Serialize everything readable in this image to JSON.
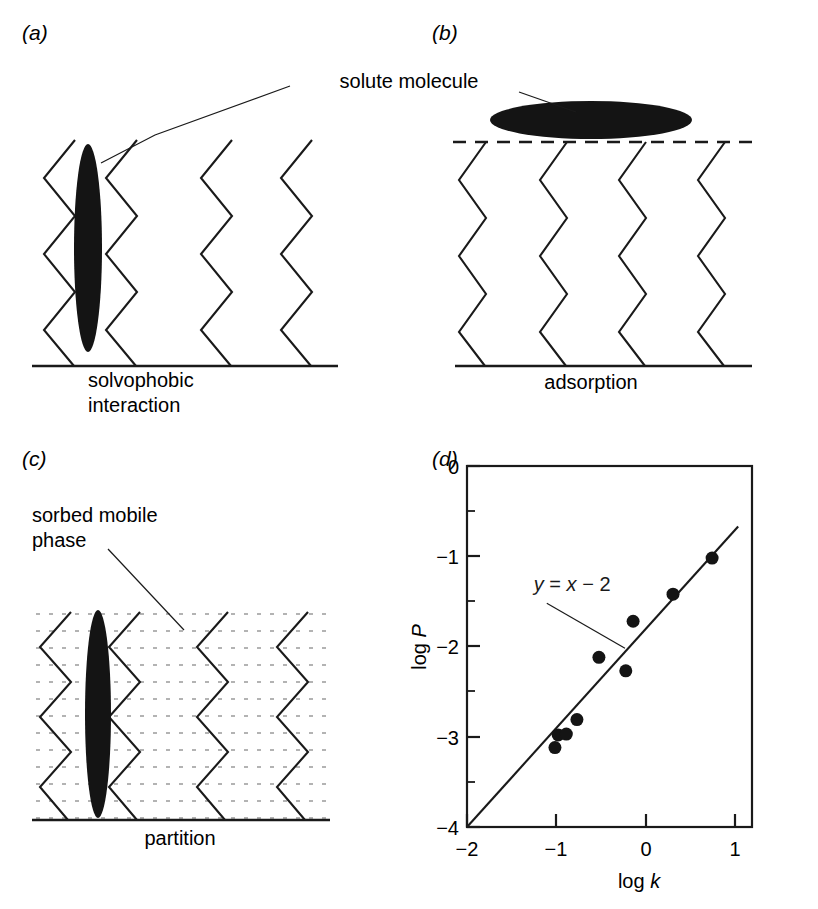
{
  "figure": {
    "panels": [
      {
        "key": "a",
        "label": "(a)",
        "caption_line1": "solvophobic",
        "caption_line2": "interaction",
        "annotation": "solute molecule",
        "chains": 4,
        "molecule_orientation": "vertical-ellipse"
      },
      {
        "key": "b",
        "label": "(b)",
        "caption_line1": "adsorption",
        "caption_line2": "",
        "annotation": "solute molecule",
        "chains": 4,
        "molecule_orientation": "horizontal-ellipse"
      },
      {
        "key": "c",
        "label": "(c)",
        "caption_line1": "partition",
        "caption_line2": "",
        "annotation_line1": "sorbed mobile",
        "annotation_line2": "phase",
        "chains": 4,
        "molecule_orientation": "vertical-ellipse"
      },
      {
        "key": "d",
        "label": "(d)",
        "caption_line1": "",
        "caption_line2": ""
      }
    ],
    "colors": {
      "ink": "#1a1a1a",
      "molecule": "#141414",
      "sorbed_phase_dots": "#9a9a9a"
    }
  },
  "chart_data": {
    "type": "scatter",
    "title": "",
    "xlabel": "log k",
    "ylabel": "log P",
    "xlim": [
      -2,
      1.5
    ],
    "ylim": [
      -4,
      0
    ],
    "xticks": [
      -2,
      -1,
      0,
      1
    ],
    "xtick_labels": [
      "−2",
      "−1",
      "0",
      "1"
    ],
    "yticks": [
      0,
      -1,
      -2,
      -3,
      -4
    ],
    "ytick_labels": [
      "0",
      "−1",
      "−2",
      "−3",
      "−4"
    ],
    "x_minor_ticks": [
      -1.5,
      -0.5,
      0.5
    ],
    "y_minor_ticks": [
      -0.5,
      -1.5,
      -2.5,
      -3.5
    ],
    "grid": false,
    "legend": false,
    "annotations": [
      {
        "text": "y = x − 2",
        "text_x": -1.18,
        "text_y": -1.38,
        "leader_from_x": -1.02,
        "leader_from_y": -1.52,
        "leader_to_x": -0.06,
        "leader_to_y": -2.02
      }
    ],
    "fit_line": {
      "label": "y = x − 2",
      "slope": 1,
      "intercept": -2,
      "x_start": -2,
      "x_end": 1.33
    },
    "points": [
      {
        "x": -0.92,
        "y": -3.12
      },
      {
        "x": -0.88,
        "y": -2.98
      },
      {
        "x": -0.78,
        "y": -2.97
      },
      {
        "x": -0.65,
        "y": -2.81
      },
      {
        "x": -0.38,
        "y": -2.12
      },
      {
        "x": -0.05,
        "y": -2.27
      },
      {
        "x": 0.04,
        "y": -1.72
      },
      {
        "x": 0.53,
        "y": -1.42
      },
      {
        "x": 1.01,
        "y": -1.02
      }
    ],
    "marker": {
      "shape": "circle",
      "size": 13,
      "color": "#141414"
    }
  }
}
